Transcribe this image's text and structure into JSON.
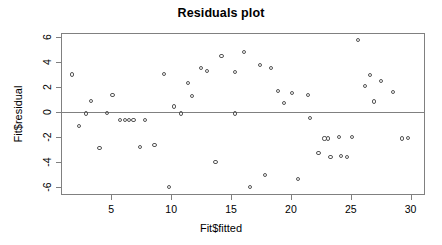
{
  "chart_data": {
    "type": "scatter",
    "title": "Residuals plot",
    "xlabel": "Fit$fitted",
    "ylabel": "Fit$residual",
    "xlim": [
      0.8,
      31.2
    ],
    "ylim": [
      -6.6,
      6.3
    ],
    "xticks": [
      5,
      10,
      15,
      20,
      25,
      30
    ],
    "yticks": [
      6,
      4,
      2,
      0,
      -2,
      -4,
      -6
    ],
    "xtick_labels": [
      "5",
      "10",
      "15",
      "20",
      "25",
      "30"
    ],
    "ytick_labels": [
      "6",
      "4",
      "2",
      "0",
      "-2",
      "-4",
      "-6"
    ],
    "grid": false,
    "legend": null,
    "reference_line": {
      "orientation": "horizontal",
      "y": 0,
      "color": "#808080"
    },
    "marker": {
      "shape": "open-circle",
      "color": "#555555",
      "size": 4
    },
    "series": [
      {
        "name": "residuals",
        "points": [
          [
            1.7,
            3.0
          ],
          [
            2.3,
            -1.1
          ],
          [
            2.9,
            -0.1
          ],
          [
            3.3,
            0.9
          ],
          [
            4.0,
            -2.85
          ],
          [
            4.6,
            -0.05
          ],
          [
            5.1,
            1.35
          ],
          [
            5.7,
            -0.65
          ],
          [
            6.15,
            -0.6
          ],
          [
            6.5,
            -0.65
          ],
          [
            6.85,
            -0.65
          ],
          [
            7.4,
            -2.8
          ],
          [
            7.8,
            -0.65
          ],
          [
            8.6,
            -2.6
          ],
          [
            9.4,
            3.05
          ],
          [
            9.8,
            -5.95
          ],
          [
            10.2,
            0.45
          ],
          [
            10.8,
            -0.1
          ],
          [
            11.4,
            2.35
          ],
          [
            11.7,
            1.3
          ],
          [
            12.5,
            3.55
          ],
          [
            13.0,
            3.25
          ],
          [
            13.7,
            -3.95
          ],
          [
            14.2,
            4.45
          ],
          [
            15.3,
            3.2
          ],
          [
            15.35,
            -0.1
          ],
          [
            16.1,
            4.8
          ],
          [
            16.6,
            -5.95
          ],
          [
            17.4,
            3.75
          ],
          [
            17.8,
            -5.0
          ],
          [
            18.3,
            3.5
          ],
          [
            18.9,
            1.7
          ],
          [
            19.4,
            0.75
          ],
          [
            20.1,
            1.55
          ],
          [
            20.6,
            -5.3
          ],
          [
            21.4,
            1.4
          ],
          [
            21.6,
            -0.45
          ],
          [
            22.3,
            -3.25
          ],
          [
            22.8,
            -2.1
          ],
          [
            23.1,
            -2.1
          ],
          [
            23.3,
            -3.55
          ],
          [
            24.0,
            -2.0
          ],
          [
            24.2,
            -3.5
          ],
          [
            24.7,
            -3.55
          ],
          [
            25.1,
            -2.0
          ],
          [
            25.6,
            5.75
          ],
          [
            26.2,
            2.1
          ],
          [
            26.6,
            2.95
          ],
          [
            26.9,
            0.85
          ],
          [
            27.5,
            2.5
          ],
          [
            28.5,
            1.6
          ],
          [
            29.3,
            -2.1
          ],
          [
            29.8,
            -2.05
          ]
        ]
      }
    ]
  }
}
